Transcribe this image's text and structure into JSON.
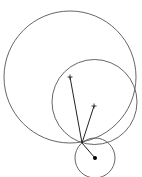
{
  "diagram": {
    "type": "geometry-circles",
    "canvas": {
      "width": 142,
      "height": 177,
      "background": "#ffffff"
    },
    "stroke_color": "#555555",
    "circles": [
      {
        "name": "large-circle",
        "cx": 70,
        "cy": 77,
        "r": 66
      },
      {
        "name": "medium-circle",
        "cx": 94.5,
        "cy": 102,
        "r": 42.5
      },
      {
        "name": "small-circle",
        "cx": 95,
        "cy": 158,
        "r": 20
      }
    ],
    "center_markers": [
      {
        "name": "large-circle-center",
        "x": 70,
        "y": 77
      },
      {
        "name": "medium-circle-center",
        "x": 94,
        "y": 106
      }
    ],
    "tangent_point": {
      "x": 82,
      "y": 143
    },
    "segments": [
      {
        "name": "radius-to-large-center",
        "x1": 82,
        "y1": 143,
        "x2": 70,
        "y2": 77
      },
      {
        "name": "radius-to-medium-center",
        "x1": 82,
        "y1": 143,
        "x2": 94,
        "y2": 106
      },
      {
        "name": "radius-to-small-center",
        "x1": 82,
        "y1": 143,
        "x2": 95,
        "y2": 158
      }
    ],
    "filled_point": {
      "name": "small-circle-center-dot",
      "x": 95,
      "y": 158,
      "r": 2
    }
  }
}
